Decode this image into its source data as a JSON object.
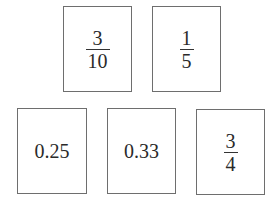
{
  "cards": [
    {
      "type": "fraction",
      "numerator": "3",
      "denominator": "10"
    },
    {
      "type": "fraction",
      "numerator": "1",
      "denominator": "5"
    },
    {
      "type": "decimal",
      "value": "0.25"
    },
    {
      "type": "decimal",
      "value": "0.33"
    },
    {
      "type": "fraction",
      "numerator": "3",
      "denominator": "4"
    }
  ]
}
